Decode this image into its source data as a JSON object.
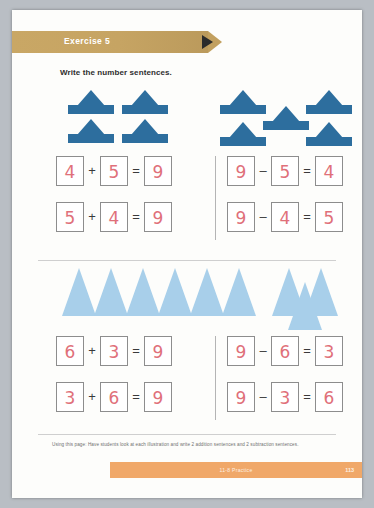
{
  "banner": {
    "label": "Exercise 5",
    "color": "#c2a05f"
  },
  "instruction": "Write the number sentences.",
  "illustrations": {
    "top": {
      "icon": "sailboat-icon",
      "color": "#2d6e9e",
      "left_count": 4,
      "right_count": 5,
      "total": 9
    },
    "bottom": {
      "icon": "triangle-hat-icon",
      "color": "#a8cfea",
      "left_count": 6,
      "right_count": 3,
      "total": 9
    }
  },
  "answer_color": "#e0707a",
  "sections": [
    {
      "name": "top",
      "rows": [
        {
          "left": {
            "a": "4",
            "op": "+",
            "b": "5",
            "eq": "=",
            "result": "9"
          },
          "right": {
            "a": "9",
            "op": "–",
            "b": "5",
            "eq": "=",
            "result": "4"
          }
        },
        {
          "left": {
            "a": "5",
            "op": "+",
            "b": "4",
            "eq": "=",
            "result": "9"
          },
          "right": {
            "a": "9",
            "op": "–",
            "b": "4",
            "eq": "=",
            "result": "5"
          }
        }
      ]
    },
    {
      "name": "bottom",
      "rows": [
        {
          "left": {
            "a": "6",
            "op": "+",
            "b": "3",
            "eq": "=",
            "result": "9"
          },
          "right": {
            "a": "9",
            "op": "–",
            "b": "6",
            "eq": "=",
            "result": "3"
          }
        },
        {
          "left": {
            "a": "3",
            "op": "+",
            "b": "6",
            "eq": "=",
            "result": "9"
          },
          "right": {
            "a": "9",
            "op": "–",
            "b": "3",
            "eq": "=",
            "result": "6"
          }
        }
      ]
    }
  ],
  "note": "Using this page: Have students look at each illustration and write 2 addition sentences and 2 subtraction sentences.",
  "footer": {
    "center": "11-8 Practice",
    "page": "113",
    "color": "#f0a869"
  }
}
